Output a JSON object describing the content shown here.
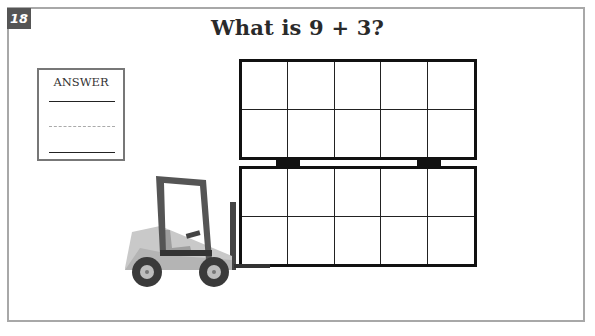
{
  "question": {
    "number": "18",
    "title": "What is 9 + 3?"
  },
  "answer_box": {
    "label": "ANSWER",
    "lines": [
      "solid",
      "dashed",
      "solid"
    ]
  },
  "ten_frames": [
    {
      "rows": 2,
      "cols": 5,
      "filled": 0
    },
    {
      "rows": 2,
      "cols": 5,
      "filled": 0
    }
  ],
  "illustration": {
    "name": "forklift-icon",
    "colors": {
      "body": "#c9c9c9",
      "body_dark": "#a9a9a9",
      "cab": "#5a5a5a",
      "mast": "#444444",
      "tire": "#3a3a3a",
      "hub": "#bdbdbd"
    }
  },
  "colors": {
    "frame_border": "#a8a8a8",
    "badge_bg": "#555555",
    "title_text": "#2a2a2a",
    "grid_lines": "#111111"
  }
}
